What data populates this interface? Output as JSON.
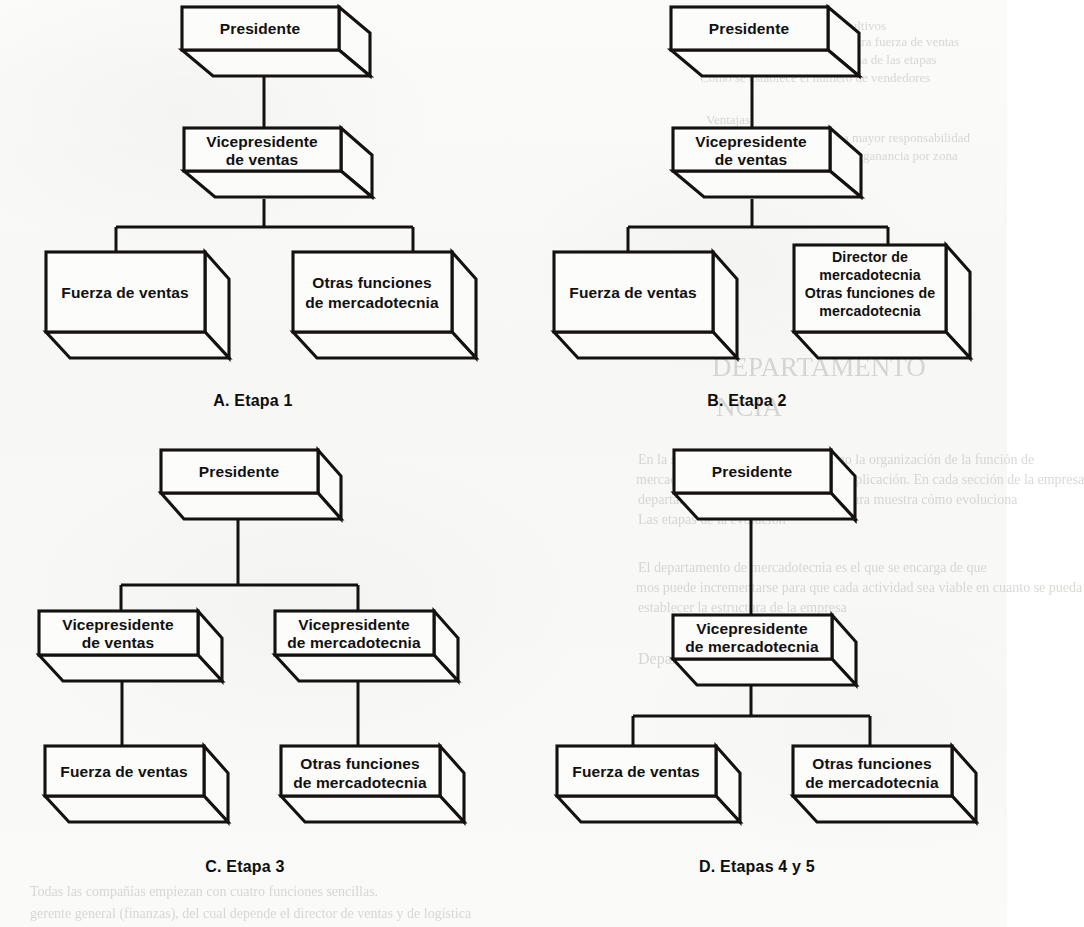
{
  "page": {
    "kind": "scanned-textbook-figure",
    "background_color": "#faf9f7",
    "ink_color": "#14120f",
    "figure_count": 4
  },
  "labels": {
    "presidente": "Presidente",
    "vp_ventas_l1": "Vicepresidente",
    "vp_ventas_l2": "de ventas",
    "vp_mercadotecnia_l1": "Vicepresidente",
    "vp_mercadotecnia_l2": "de mercadotecnia",
    "fuerza_de_ventas": "Fuerza de ventas",
    "otras_funciones_l1": "Otras funciones",
    "otras_funciones_l2": "de mercadotecnia",
    "director_merc_l1": "Director de",
    "director_merc_l2": "mercadotecnia",
    "director_merc_l3": "Otras funciones de",
    "director_merc_l4": "mercadotecnia"
  },
  "captions": {
    "a": "A.  Etapa 1",
    "b": "B.  Etapa 2",
    "c": "C.  Etapa 3",
    "d": "D. Etapas 4 y 5"
  },
  "diagrams": [
    {
      "id": "a",
      "caption": "A.  Etapa 1",
      "nodes": [
        {
          "id": "a-presidente",
          "label": "Presidente",
          "level": 1
        },
        {
          "id": "a-vp-ventas",
          "label": "Vicepresidente de ventas",
          "level": 2
        },
        {
          "id": "a-fuerza",
          "label": "Fuerza de ventas",
          "level": 3
        },
        {
          "id": "a-otras",
          "label": "Otras funciones de mercadotecnia",
          "level": 3
        }
      ],
      "edges": [
        {
          "from": "a-presidente",
          "to": "a-vp-ventas"
        },
        {
          "from": "a-vp-ventas",
          "to": "a-fuerza"
        },
        {
          "from": "a-vp-ventas",
          "to": "a-otras"
        }
      ]
    },
    {
      "id": "b",
      "caption": "B.  Etapa 2",
      "nodes": [
        {
          "id": "b-presidente",
          "label": "Presidente",
          "level": 1
        },
        {
          "id": "b-vp-ventas",
          "label": "Vicepresidente de ventas",
          "level": 2
        },
        {
          "id": "b-fuerza",
          "label": "Fuerza de ventas",
          "level": 3
        },
        {
          "id": "b-director",
          "label": "Director de mercadotecnia Otras funciones de mercadotecnia",
          "level": 3
        }
      ],
      "edges": [
        {
          "from": "b-presidente",
          "to": "b-vp-ventas"
        },
        {
          "from": "b-vp-ventas",
          "to": "b-fuerza"
        },
        {
          "from": "b-vp-ventas",
          "to": "b-director"
        }
      ]
    },
    {
      "id": "c",
      "caption": "C.  Etapa 3",
      "nodes": [
        {
          "id": "c-presidente",
          "label": "Presidente",
          "level": 1
        },
        {
          "id": "c-vp-ventas",
          "label": "Vicepresidente de ventas",
          "level": 2
        },
        {
          "id": "c-vp-merc",
          "label": "Vicepresidente de mercadotecnia",
          "level": 2
        },
        {
          "id": "c-fuerza",
          "label": "Fuerza de ventas",
          "level": 3
        },
        {
          "id": "c-otras",
          "label": "Otras funciones de mercadotecnia",
          "level": 3
        }
      ],
      "edges": [
        {
          "from": "c-presidente",
          "to": "c-vp-ventas"
        },
        {
          "from": "c-presidente",
          "to": "c-vp-merc"
        },
        {
          "from": "c-vp-ventas",
          "to": "c-fuerza"
        },
        {
          "from": "c-vp-merc",
          "to": "c-otras"
        }
      ]
    },
    {
      "id": "d",
      "caption": "D. Etapas 4 y 5",
      "nodes": [
        {
          "id": "d-presidente",
          "label": "Presidente",
          "level": 1
        },
        {
          "id": "d-vp-merc",
          "label": "Vicepresidente de mercadotecnia",
          "level": 2
        },
        {
          "id": "d-fuerza",
          "label": "Fuerza de ventas",
          "level": 3
        },
        {
          "id": "d-otras",
          "label": "Otras funciones de mercadotecnia",
          "level": 3
        }
      ],
      "edges": [
        {
          "from": "d-presidente",
          "to": "d-vp-merc"
        },
        {
          "from": "d-vp-merc",
          "to": "d-fuerza"
        },
        {
          "from": "d-vp-merc",
          "to": "d-otras"
        }
      ]
    }
  ],
  "bleedthrough": {
    "note": "Faint mirrored text showing through from the reverse page; largely illegible in the scan.",
    "fragments": [
      {
        "text": "Cultivos",
        "x": 842,
        "y": 18,
        "size": 13
      },
      {
        "text": "Decidir si se va a contratar a otra fuerza de ventas",
        "x": 700,
        "y": 34,
        "size": 13
      },
      {
        "text": "Analizar los costos de cada una de las etapas",
        "x": 704,
        "y": 52,
        "size": 13
      },
      {
        "text": "Cómo se establece el número de vendedores",
        "x": 700,
        "y": 70,
        "size": 13
      },
      {
        "text": "Ventajas",
        "x": 706,
        "y": 112,
        "size": 13
      },
      {
        "text": "Hacer que el vendedor tenga mayor responsabilidad",
        "x": 700,
        "y": 130,
        "size": 13
      },
      {
        "text": "para incrementar el margen de ganancia por zona",
        "x": 702,
        "y": 148,
        "size": 13
      },
      {
        "text": "El cliente",
        "x": 706,
        "y": 166,
        "size": 13
      },
      {
        "text": "DEPARTAMENTO",
        "x": 712,
        "y": 352,
        "size": 27
      },
      {
        "text": "NCIA",
        "x": 716,
        "y": 392,
        "size": 27
      },
      {
        "text": "En la sección anterior se mostró cómo la organización de la función de",
        "x": 638,
        "y": 452,
        "size": 14
      },
      {
        "text": "mercadotecnia apoya la creciente multiplicación. En cada sección de la empresa",
        "x": 636,
        "y": 472,
        "size": 14
      },
      {
        "text": "departamento de mercadotecnia, la figura muestra cómo evoluciona",
        "x": 638,
        "y": 492,
        "size": 14
      },
      {
        "text": "Las etapas de la evolución",
        "x": 638,
        "y": 512,
        "size": 14
      },
      {
        "text": "El departamento de mercadotecnia es el que se encarga de que",
        "x": 638,
        "y": 560,
        "size": 14
      },
      {
        "text": "mos puede incrementarse para que cada actividad sea viable en cuanto se pueda",
        "x": 636,
        "y": 580,
        "size": 14
      },
      {
        "text": "establecer la estructura de la empresa",
        "x": 638,
        "y": 600,
        "size": 14
      },
      {
        "text": "Departamento de ventas sencillo",
        "x": 638,
        "y": 650,
        "size": 16
      },
      {
        "text": "Todas las compañías empiezan con cuatro funciones sencillas.",
        "x": 30,
        "y": 884,
        "size": 14
      },
      {
        "text": "gerente general (finanzas), del cual depende el director de ventas y de logística",
        "x": 30,
        "y": 906,
        "size": 14
      }
    ]
  }
}
